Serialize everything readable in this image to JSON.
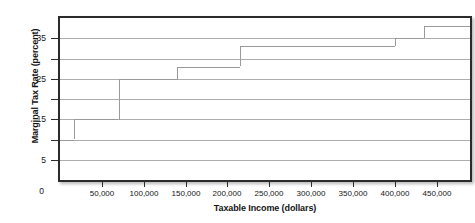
{
  "chart_data": {
    "type": "line",
    "title": "",
    "xlabel": "Taxable Income (dollars)",
    "ylabel": "Marginal Tax Rate (percent)",
    "xlim": [
      0,
      490000
    ],
    "ylim": [
      0,
      40
    ],
    "grid": true,
    "legend": false,
    "x_tick_labels": [
      "50,000",
      "100,000",
      "150,000",
      "200,000",
      "250,000",
      "300,000",
      "350,000",
      "400,000",
      "450,000"
    ],
    "x_tick_values": [
      50000,
      100000,
      150000,
      200000,
      250000,
      300000,
      350000,
      400000,
      450000
    ],
    "y_tick_labels": [
      "0",
      "5",
      "15",
      "25",
      "35"
    ],
    "y_tick_values": [
      0,
      5,
      15,
      25,
      35
    ],
    "y_gridline_values": [
      5,
      10,
      15,
      20,
      25,
      30,
      35
    ],
    "origin_label": "0",
    "series": [
      {
        "name": "Marginal tax rate",
        "style": "step",
        "color": "#9a9a9a",
        "steps": [
          {
            "x_start": 0,
            "x_end": 17000,
            "rate": 10
          },
          {
            "x_start": 17000,
            "x_end": 70000,
            "rate": 15
          },
          {
            "x_start": 70000,
            "x_end": 140000,
            "rate": 25
          },
          {
            "x_start": 140000,
            "x_end": 215000,
            "rate": 28
          },
          {
            "x_start": 215000,
            "x_end": 400000,
            "rate": 33
          },
          {
            "x_start": 400000,
            "x_end": 435000,
            "rate": 35
          },
          {
            "x_start": 435000,
            "x_end": 490000,
            "rate": 38
          }
        ]
      }
    ]
  }
}
